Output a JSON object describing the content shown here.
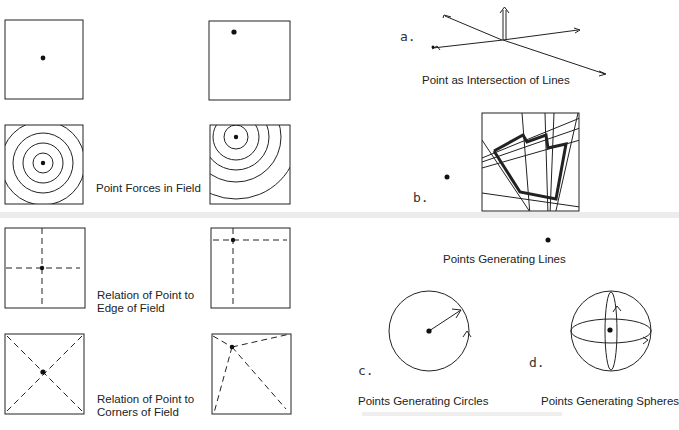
{
  "left_panel": {
    "rows": [
      {
        "label": "",
        "left_square": "point-center",
        "right_square": "point-upper-left"
      },
      {
        "label": "Point Forces in Field",
        "left_square": "concentric-circles-center",
        "right_square": "concentric-circles-upper-left"
      },
      {
        "label_line1": "Relation of Point to",
        "label_line2": "Edge of Field",
        "left_square": "dashed-cross-center",
        "right_square": "dashed-cross-upper-left"
      },
      {
        "label_line1": "Relation of Point to",
        "label_line2": "Corners of Field",
        "left_square": "dashed-diagonals-center",
        "right_square": "dashed-lines-to-corners-upper-left"
      }
    ]
  },
  "right_panel": {
    "a": {
      "letter": "a.",
      "caption": "Point as Intersection of Lines"
    },
    "b": {
      "letter": "b.",
      "caption": "Points Generating Lines"
    },
    "c": {
      "letter": "c.",
      "caption": "Points Generating Circles"
    },
    "d": {
      "letter": "d.",
      "caption": "Points Generating Spheres"
    }
  },
  "colors": {
    "ink": "#222222",
    "background": "#ffffff",
    "band": "#ececec"
  }
}
